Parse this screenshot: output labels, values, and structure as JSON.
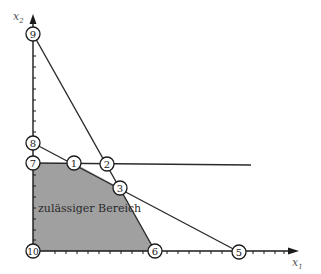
{
  "diagram": {
    "title": "",
    "axes": {
      "x": {
        "label": "x",
        "subscript": "1"
      },
      "y": {
        "label": "x",
        "subscript": "2"
      }
    },
    "region": {
      "label": "zulässiger Bereich",
      "fill": "#a0a0a0"
    },
    "nodes": [
      {
        "id": "1",
        "label": "1"
      },
      {
        "id": "2",
        "label": "2"
      },
      {
        "id": "3",
        "label": "3"
      },
      {
        "id": "5",
        "label": "5"
      },
      {
        "id": "6",
        "label": "6"
      },
      {
        "id": "7",
        "label": "7"
      },
      {
        "id": "8",
        "label": "8"
      },
      {
        "id": "9",
        "label": "9"
      },
      {
        "id": "10",
        "label": "10"
      }
    ],
    "colors": {
      "line": "#2a2a2a",
      "region": "#a0a0a0",
      "background": "#ffffff"
    }
  }
}
